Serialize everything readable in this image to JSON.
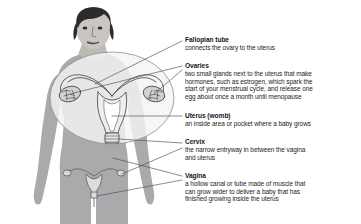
{
  "figure": {
    "magnifier": "circular-magnified-inset-of-uterus",
    "colors": {
      "background": "#ffffff",
      "body_fill": "#a9aaac",
      "body_fill_light": "#c9cacc",
      "hair": "#2b2b2d",
      "skin_face": "#c9c6c2",
      "organ_line": "#4a4a4d",
      "organ_fill": "#efefef",
      "leader_line": "#4e4e52",
      "text": "#17171a"
    }
  },
  "labels": [
    {
      "id": "fallopian-tube",
      "title": "Fallopian tube",
      "lines": [
        "connects the ovary to the uterus"
      ]
    },
    {
      "id": "ovaries",
      "title": "Ovaries",
      "lines": [
        "two small glands next to the uterus that make",
        "hormones, such as estrogen, which spark the",
        "start of your menstrual cycle, and release one",
        "egg about once a month until menopause"
      ]
    },
    {
      "id": "uterus-womb",
      "title": "Uterus (womb)",
      "lines": [
        "an inside area or pocket where a baby grows"
      ]
    },
    {
      "id": "cervix",
      "title": "Cervix",
      "lines": [
        "the narrow entryway in between the vagina",
        "and uterus"
      ]
    },
    {
      "id": "vagina",
      "title": "Vagina",
      "lines": [
        "a hollow canal or tube made of muscle that",
        "can grow wider to deliver a baby that has",
        "finished growing inside the uterus"
      ]
    }
  ]
}
